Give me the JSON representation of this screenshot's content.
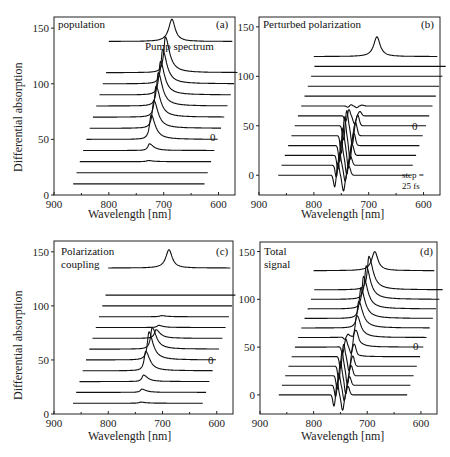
{
  "chart_data": [
    {
      "type": "line",
      "panel": "(a)",
      "title": "population",
      "xlabel": "Wavelength  [nm]",
      "ylabel": "Differential absorption",
      "xlim": [
        900,
        570
      ],
      "ylim": [
        0,
        160
      ],
      "xticks": [
        900,
        800,
        700,
        600
      ],
      "yticks": [
        0,
        50,
        100,
        150
      ],
      "annotations": [
        "Pump spectrum",
        "0"
      ],
      "pump_spectrum": {
        "baseline": 138,
        "peak_nm": 685,
        "peak_height": 20,
        "width_nm": 7
      },
      "waterfall": {
        "n_traces": 11,
        "first_baseline": 10,
        "step": 10,
        "x_shift_nm_per_trace": 6,
        "zero_trace_index": 5,
        "peaks": [
          0,
          0,
          1,
          6,
          22,
          25,
          28,
          30,
          30,
          31,
          32
        ],
        "peak_nm": [
          730,
          730,
          728,
          726,
          723,
          718,
          714,
          710,
          706,
          702,
          697
        ]
      }
    },
    {
      "type": "line",
      "panel": "(b)",
      "title": "Perturbed polarization",
      "xlabel": "Wavelength [nm]",
      "ylabel": "",
      "xlim": [
        900,
        570
      ],
      "ylim": [
        -20,
        160
      ],
      "xticks": [
        900,
        800,
        700,
        600
      ],
      "yticks": [
        0,
        50,
        100,
        150
      ],
      "annotations": [
        "0",
        "step =",
        "25 fs"
      ],
      "pump_spectrum": {
        "baseline": 120,
        "peak_nm": 685,
        "peak_height": 20,
        "width_nm": 7
      },
      "waterfall": {
        "n_traces": 12,
        "first_baseline": 0,
        "step": 10,
        "x_shift_nm_per_trace": 6,
        "zero_trace_index": 5,
        "dispersive_amp": [
          10,
          10,
          12,
          14,
          15,
          12,
          5,
          1,
          0,
          0,
          0,
          0
        ],
        "center_nm": [
          750,
          747,
          744,
          741,
          738,
          734,
          730,
          726,
          722,
          718,
          714,
          710
        ]
      }
    },
    {
      "type": "line",
      "panel": "(c)",
      "title": "Polarization coupling",
      "xlabel": "Wavelength [nm]",
      "ylabel": "Differential absorption",
      "xlim": [
        900,
        570
      ],
      "ylim": [
        0,
        160
      ],
      "xticks": [
        900,
        800,
        700,
        600
      ],
      "yticks": [
        0,
        50,
        100,
        150
      ],
      "annotations": [
        "0"
      ],
      "pump_spectrum": {
        "baseline": 135,
        "peak_nm": 688,
        "peak_height": 17,
        "width_nm": 7
      },
      "waterfall": {
        "n_traces": 11,
        "first_baseline": 10,
        "step": 10,
        "x_shift_nm_per_trace": 6,
        "zero_trace_index": 5,
        "peaks": [
          1,
          3,
          6,
          18,
          26,
          20,
          8,
          2,
          1,
          0,
          0
        ],
        "peak_nm": [
          740,
          738,
          735,
          731,
          725,
          719,
          712,
          707,
          702,
          698,
          694
        ]
      }
    },
    {
      "type": "line",
      "panel": "(d)",
      "title": "Total signal",
      "xlabel": "Wavelength [nm]",
      "ylabel": "",
      "xlim": [
        900,
        570
      ],
      "ylim": [
        -20,
        160
      ],
      "xticks": [
        900,
        800,
        700,
        600
      ],
      "yticks": [
        0,
        50,
        100,
        150
      ],
      "annotations": [
        "0"
      ],
      "pump_spectrum": {
        "baseline": 130,
        "peak_nm": 686,
        "peak_height": 20,
        "width_nm": 7
      },
      "waterfall": {
        "n_traces": 12,
        "first_baseline": 0,
        "step": 10,
        "x_shift_nm_per_trace": 6,
        "zero_trace_index": 5,
        "dispersive_amp": [
          10,
          10,
          12,
          12,
          10,
          6,
          2,
          0,
          0,
          0,
          0,
          0
        ],
        "center_nm": [
          750,
          747,
          744,
          741,
          738,
          734,
          730,
          726,
          722,
          718,
          714,
          710
        ],
        "peaks": [
          0,
          0,
          0,
          0,
          5,
          14,
          22,
          28,
          32,
          34,
          35,
          35
        ],
        "peak_nm": [
          740,
          737,
          734,
          731,
          728,
          724,
          720,
          716,
          712,
          707,
          702,
          697
        ]
      }
    }
  ],
  "labels": {
    "a": {
      "title": "population",
      "tag": "(a)",
      "pump": "Pump spectrum",
      "zero": "0",
      "xlabel": "Wavelength  [nm]",
      "ylabel": "Differential absorption"
    },
    "b": {
      "title": "Perturbed polarization",
      "tag": "(b)",
      "zero": "0",
      "step1": "step =",
      "step2": "25 fs",
      "xlabel": "Wavelength [nm]"
    },
    "c": {
      "title1": "Polarization",
      "title2": "coupling",
      "tag": "(c)",
      "zero": "0",
      "xlabel": "Wavelength [nm]",
      "ylabel": "Differential absorption"
    },
    "d": {
      "title1": "Total",
      "title2": "signal",
      "tag": "(d)",
      "zero": "0",
      "xlabel": "Wavelength [nm]"
    },
    "xticks": [
      "900",
      "800",
      "700",
      "600"
    ],
    "yticks": [
      "0",
      "50",
      "100",
      "150"
    ]
  }
}
